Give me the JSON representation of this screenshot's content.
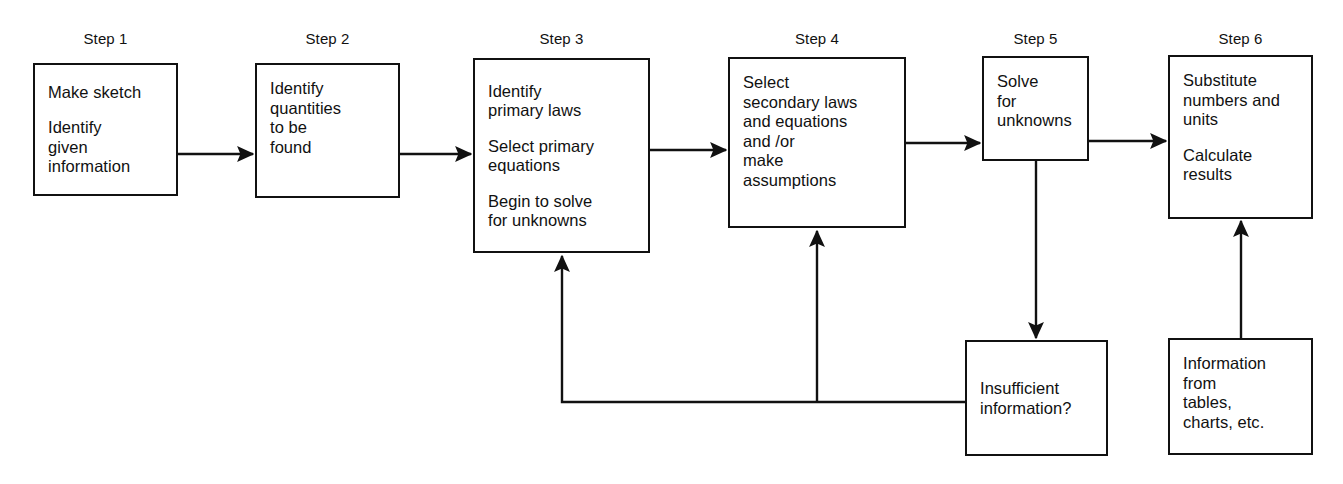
{
  "diagram": {
    "stroke_color": "#111111",
    "background_color": "#ffffff"
  },
  "step_labels": [
    {
      "id": "step-1",
      "text": "Step 1"
    },
    {
      "id": "step-2",
      "text": "Step 2"
    },
    {
      "id": "step-3",
      "text": "Step 3"
    },
    {
      "id": "step-4",
      "text": "Step 4"
    },
    {
      "id": "step-5",
      "text": "Step 5"
    },
    {
      "id": "step-6",
      "text": "Step 6"
    }
  ],
  "nodes": {
    "step1": {
      "label": "Step 1",
      "lines": [
        "Make sketch",
        "Identify\ngiven\ninformation"
      ]
    },
    "step2": {
      "label": "Step 2",
      "lines": [
        "Identify\nquantities\nto be\nfound"
      ]
    },
    "step3": {
      "label": "Step 3",
      "lines": [
        "Identify\nprimary laws",
        "Select primary\nequations",
        "Begin to solve\nfor unknowns"
      ]
    },
    "step4": {
      "label": "Step 4",
      "lines": [
        "Select\nsecondary laws\nand equations\nand /or\nmake\nassumptions"
      ]
    },
    "step5": {
      "label": "Step 5",
      "lines": [
        "Solve\nfor\nunknowns"
      ]
    },
    "step6": {
      "label": "Step 6",
      "lines": [
        "Substitute\nnumbers and\nunits",
        "Calculate\nresults"
      ]
    },
    "insufficient": {
      "lines": [
        "Insufficient\ninformation?"
      ]
    },
    "information": {
      "lines": [
        "Information\nfrom\ntables,\ncharts, etc."
      ]
    }
  },
  "connectors": [
    {
      "id": "step1-to-step2",
      "from": "step1",
      "to": "step2",
      "kind": "arrow-right"
    },
    {
      "id": "step2-to-step3",
      "from": "step2",
      "to": "step3",
      "kind": "arrow-right"
    },
    {
      "id": "step3-to-step4",
      "from": "step3",
      "to": "step4",
      "kind": "arrow-right"
    },
    {
      "id": "step4-to-step5",
      "from": "step4",
      "to": "step5",
      "kind": "arrow-right"
    },
    {
      "id": "step5-to-step6",
      "from": "step5",
      "to": "step6",
      "kind": "arrow-right"
    },
    {
      "id": "step5-to-insufficient",
      "from": "step5",
      "to": "insufficient",
      "kind": "arrow-down"
    },
    {
      "id": "insufficient-to-step3",
      "from": "insufficient",
      "to": "step3",
      "kind": "feedback-up"
    },
    {
      "id": "insufficient-to-step4",
      "from": "insufficient",
      "to": "step4",
      "kind": "feedback-up"
    },
    {
      "id": "information-to-step6",
      "from": "information",
      "to": "step6",
      "kind": "arrow-up"
    }
  ]
}
